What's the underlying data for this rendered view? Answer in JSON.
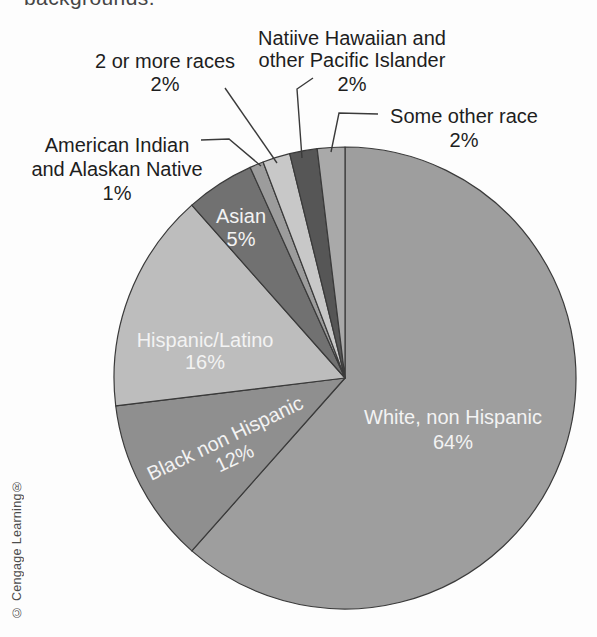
{
  "page": {
    "top_clipped_text": "backgrounds.",
    "credit": "© Cengage Learning®",
    "background_color": "#fdfdfd"
  },
  "chart_data": {
    "type": "pie",
    "title": "",
    "values_unit": "percent",
    "direction": "clockwise",
    "start_angle_deg": 0,
    "legend": "none",
    "outline_color": "#3a3a3a",
    "internal_text_color": "#f3f3f3",
    "external_text_color": "#1e1e1e",
    "label_font_px": 20,
    "line_height_px": 23,
    "center": {
      "x": 345,
      "y": 378
    },
    "radius": 231,
    "slices": [
      {
        "label": "White, non Hispanic",
        "value": 64,
        "pct": "64%",
        "color": "#9e9e9e"
      },
      {
        "label": "Black non Hispanic",
        "value": 12,
        "pct": "12%",
        "color": "#8f8f8f"
      },
      {
        "label": "Hispanic/Latino",
        "value": 16,
        "pct": "16%",
        "color": "#bdbdbd"
      },
      {
        "label": "Asian",
        "value": 5,
        "pct": "5%",
        "color": "#717171"
      },
      {
        "label": "American Indian and Alaskan Native",
        "value": 1,
        "pct": "1%",
        "color": "#9c9c9c"
      },
      {
        "label": "2 or more races",
        "value": 2,
        "pct": "2%",
        "color": "#c8c8c8"
      },
      {
        "label": "Natiive Hawaiian and other Pacific Islander",
        "value": 2,
        "pct": "2%",
        "color": "#565656"
      },
      {
        "label": "Some other race",
        "value": 2,
        "pct": "2%",
        "color": "#a9a9a9"
      }
    ],
    "internal_labels": [
      {
        "slice": 0,
        "lines": [
          "White, non Hispanic",
          "64%"
        ],
        "x": 453,
        "baselines": [
          424,
          449
        ]
      },
      {
        "slice": 1,
        "lines": [
          "Black non Hispanic",
          "12%"
        ],
        "x": 0,
        "baselines": [
          7,
          29
        ],
        "translate": [
          225,
          438
        ],
        "rotate": -25.6
      },
      {
        "slice": 2,
        "lines": [
          "Hispanic/Latino",
          "16%"
        ],
        "x": 205,
        "baselines": [
          347,
          369
        ]
      },
      {
        "slice": 3,
        "lines": [
          "Asian",
          "5%"
        ],
        "x": 241,
        "baselines": [
          223,
          246
        ]
      }
    ],
    "external_labels": [
      {
        "slice": 4,
        "lines": [
          "American Indian",
          "and Alaskan Native",
          "1%"
        ],
        "x": 117,
        "baselines": [
          152,
          176,
          200
        ],
        "leader": [
          [
            201,
            140
          ],
          [
            229,
            139
          ],
          [
            261,
            166
          ]
        ]
      },
      {
        "slice": 5,
        "lines": [
          "2 or more races",
          "2%"
        ],
        "x": 165,
        "baselines": [
          68,
          91
        ],
        "leader": [
          [
            225,
            88
          ],
          [
            277,
            163
          ]
        ]
      },
      {
        "slice": 6,
        "lines": [
          "Natiive Hawaiian and",
          "other Pacific Islander",
          "2%"
        ],
        "x": 352,
        "baselines": [
          45,
          67,
          91
        ],
        "leader": [
          [
            313,
            78
          ],
          [
            297,
            89
          ],
          [
            302,
            158
          ]
        ]
      },
      {
        "slice": 7,
        "lines": [
          "Some other race",
          "2%"
        ],
        "x": 464,
        "baselines": [
          123,
          147
        ],
        "leader": [
          [
            378,
            114
          ],
          [
            339,
            113
          ],
          [
            331,
            152
          ]
        ]
      }
    ]
  }
}
